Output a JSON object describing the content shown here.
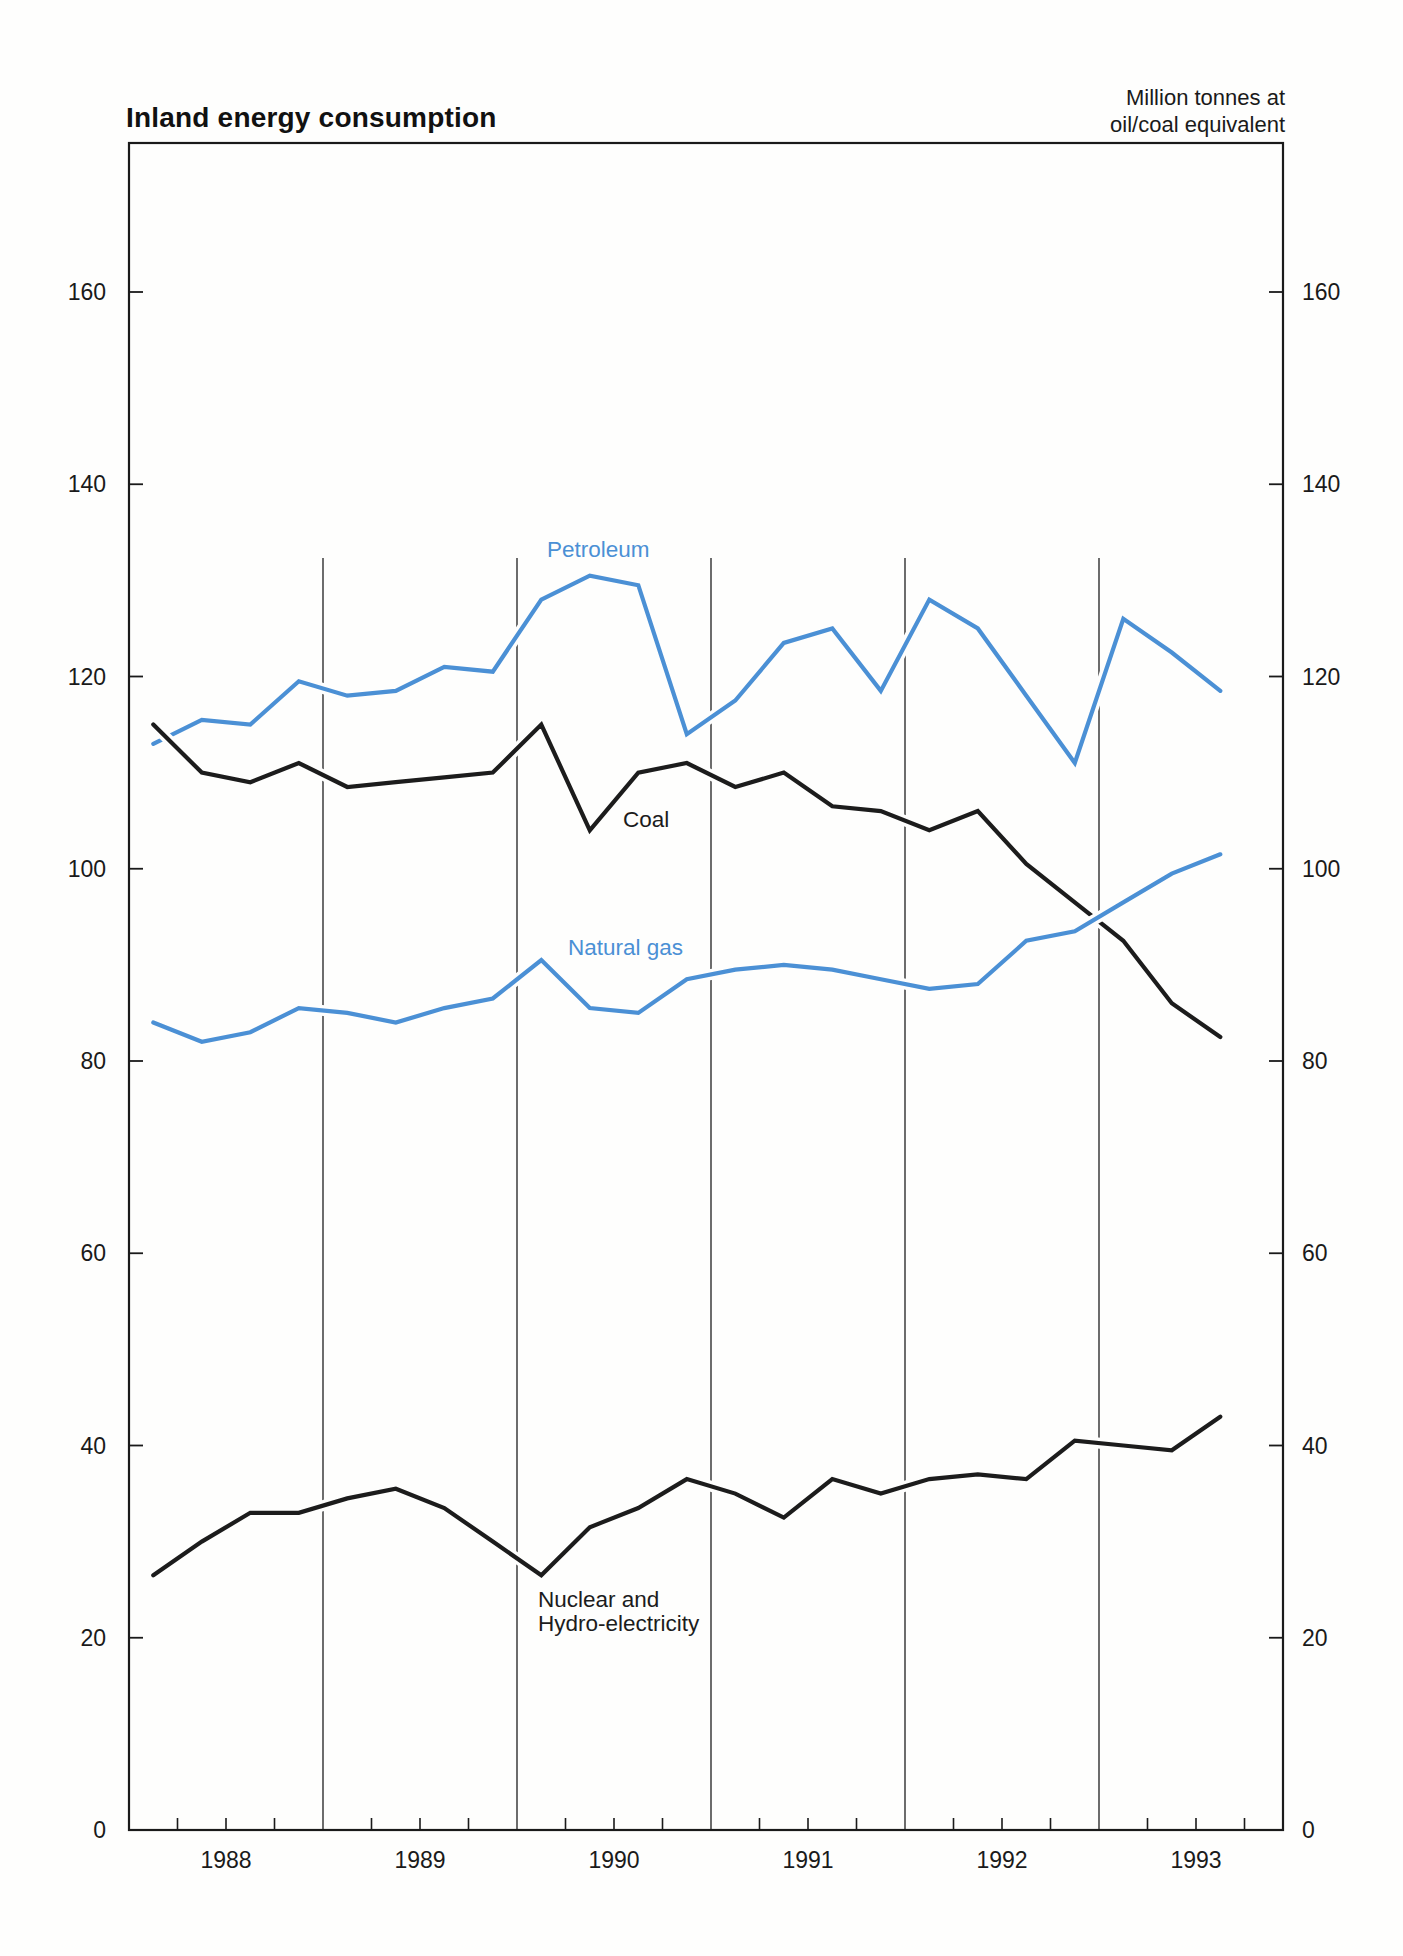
{
  "page": {
    "title": "Inland energy consumption",
    "unit_label_line1": "Million tonnes at",
    "unit_label_line2": "oil/coal equivalent"
  },
  "chart_data": {
    "type": "line",
    "title": "Inland energy consumption",
    "unit_label": [
      "Million tonnes at",
      "oil/coal equivalent"
    ],
    "x_frequency": "quarterly",
    "x_first": "1988 Q1",
    "x_last": "1993 Q3",
    "year_labels": [
      "1988",
      "1989",
      "1990",
      "1991",
      "1992",
      "1993"
    ],
    "ylabel": "Million tonnes at oil/coal equivalent",
    "ylim": [
      0,
      175
    ],
    "yticks": [
      0,
      20,
      40,
      60,
      80,
      100,
      120,
      140,
      160
    ],
    "grid": "vertical year separators only, axis labels on both left and right sides",
    "colors": {
      "blue": "#4b90d5",
      "black": "#1c1c1c"
    },
    "series": [
      {
        "name": "Petroleum",
        "color": "#4b90d5",
        "values": [
          113,
          115.5,
          115,
          119.5,
          118,
          118.5,
          121,
          120.5,
          128,
          130.5,
          129.5,
          114,
          117.5,
          123.5,
          125,
          118.5,
          128,
          125,
          118,
          111,
          126,
          122.5,
          118.5
        ],
        "label_lines": [
          "Petroleum"
        ],
        "label_pos": {
          "x": 2.155,
          "value": 132.4
        }
      },
      {
        "name": "Coal",
        "color": "#1c1c1c",
        "values": [
          115,
          110,
          109,
          111,
          108.5,
          109,
          109.5,
          110,
          115,
          104,
          110,
          111,
          108.5,
          110,
          106.5,
          106,
          104,
          106,
          100.5,
          96.5,
          92.5,
          86,
          82.5
        ],
        "label_lines": [
          "Coal"
        ],
        "label_pos": {
          "x": 2.546,
          "value": 104.3
        }
      },
      {
        "name": "Natural gas",
        "color": "#4b90d5",
        "values": [
          84,
          82,
          83,
          85.5,
          85,
          84,
          85.5,
          86.5,
          90.5,
          85.5,
          85,
          88.5,
          89.5,
          90,
          89.5,
          88.5,
          87.5,
          88,
          92.5,
          93.5,
          96.5,
          99.5,
          101.5
        ],
        "label_lines": [
          "Natural gas"
        ],
        "label_pos": {
          "x": 2.263,
          "value": 91.0
        }
      },
      {
        "name": "Nuclear and Hydro-electricity",
        "color": "#1c1c1c",
        "values": [
          26.5,
          30,
          33,
          33,
          34.5,
          35.5,
          33.5,
          30,
          26.5,
          31.5,
          33.5,
          36.5,
          35,
          32.5,
          36.5,
          35,
          36.5,
          37,
          36.5,
          40.5,
          40,
          39.5,
          43
        ],
        "label_lines": [
          "Nuclear and",
          "Hydro-electricity"
        ],
        "label_pos": {
          "x": 2.108,
          "value": 23.2
        }
      }
    ]
  }
}
